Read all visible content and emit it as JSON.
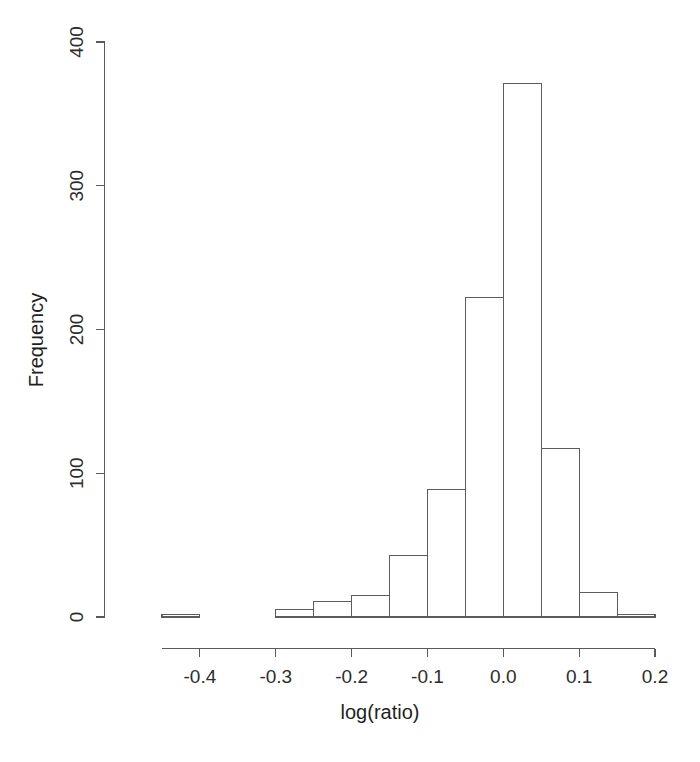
{
  "chart_data": {
    "type": "bar",
    "title": "",
    "xlabel": "log(ratio)",
    "ylabel": "Frequency",
    "xlim": [
      -0.45,
      0.21
    ],
    "ylim": [
      0,
      400
    ],
    "grid": false,
    "legend": null,
    "bin_width": 0.05,
    "x_ticks": [
      -0.4,
      -0.3,
      -0.2,
      -0.1,
      0.0,
      0.1,
      0.2
    ],
    "x_tick_labels": [
      "-0.4",
      "-0.3",
      "-0.2",
      "-0.1",
      "0.0",
      "0.1",
      "0.2"
    ],
    "y_ticks": [
      0,
      100,
      200,
      300,
      400
    ],
    "y_tick_labels": [
      "0",
      "100",
      "200",
      "300",
      "400"
    ],
    "x_axis_range": [
      -0.45,
      0.2
    ],
    "bins": [
      {
        "left": -0.45,
        "right": -0.4,
        "center": -0.425,
        "value": 2
      },
      {
        "left": -0.4,
        "right": -0.35,
        "center": -0.375,
        "value": 0
      },
      {
        "left": -0.35,
        "right": -0.3,
        "center": -0.325,
        "value": 0
      },
      {
        "left": -0.3,
        "right": -0.25,
        "center": -0.275,
        "value": 5
      },
      {
        "left": -0.25,
        "right": -0.2,
        "center": -0.225,
        "value": 11
      },
      {
        "left": -0.2,
        "right": -0.15,
        "center": -0.175,
        "value": 15
      },
      {
        "left": -0.15,
        "right": -0.1,
        "center": -0.125,
        "value": 43
      },
      {
        "left": -0.1,
        "right": -0.05,
        "center": -0.075,
        "value": 89
      },
      {
        "left": -0.05,
        "right": 0.0,
        "center": -0.025,
        "value": 222
      },
      {
        "left": 0.0,
        "right": 0.05,
        "center": 0.025,
        "value": 371
      },
      {
        "left": 0.05,
        "right": 0.1,
        "center": 0.075,
        "value": 117
      },
      {
        "left": 0.1,
        "right": 0.15,
        "center": 0.125,
        "value": 17
      },
      {
        "left": 0.15,
        "right": 0.2,
        "center": 0.175,
        "value": 2
      }
    ],
    "categories": [
      "-0.45 to -0.40",
      "-0.40 to -0.35",
      "-0.35 to -0.30",
      "-0.30 to -0.25",
      "-0.25 to -0.20",
      "-0.20 to -0.15",
      "-0.15 to -0.10",
      "-0.10 to -0.05",
      "-0.05 to 0.00",
      "0.00 to 0.05",
      "0.05 to 0.10",
      "0.10 to 0.15",
      "0.15 to 0.20"
    ],
    "values": [
      2,
      0,
      0,
      5,
      11,
      15,
      43,
      89,
      222,
      371,
      117,
      17,
      2
    ],
    "colors": {
      "bar_fill": "#ffffff",
      "bar_stroke": "#5c5c5c",
      "axis": "#5a5a5a",
      "text": "#2d2d2d",
      "background": "#ffffff"
    }
  }
}
